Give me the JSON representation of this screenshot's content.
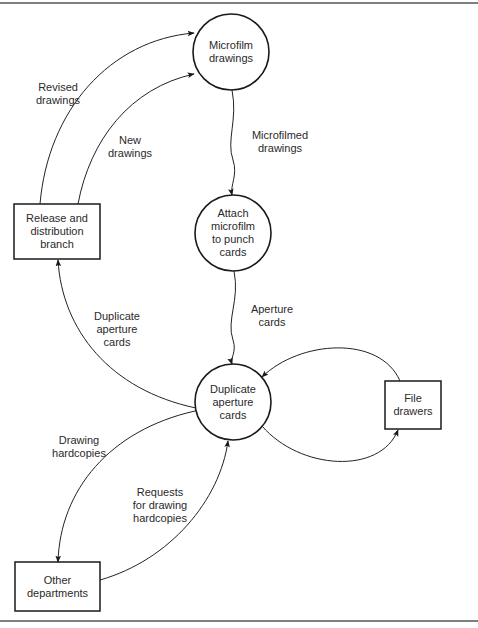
{
  "diagram": {
    "type": "data-flow-diagram",
    "nodes": {
      "microfilm": {
        "shape": "circle",
        "lines": [
          "Microfilm",
          "drawings"
        ]
      },
      "attach": {
        "shape": "circle",
        "lines": [
          "Attach",
          "microfilm",
          "to punch",
          "cards"
        ]
      },
      "duplicate": {
        "shape": "circle",
        "lines": [
          "Duplicate",
          "aperture",
          "cards"
        ]
      },
      "release": {
        "shape": "box",
        "lines": [
          "Release and",
          "distribution",
          "branch"
        ]
      },
      "file_drawers": {
        "shape": "box",
        "lines": [
          "File",
          "drawers"
        ]
      },
      "other_departments": {
        "shape": "box",
        "lines": [
          "Other",
          "departments"
        ]
      }
    },
    "flows": {
      "revised_drawings": {
        "from": "Release and distribution branch",
        "to": "Microfilm drawings",
        "lines": [
          "Revised",
          "drawings"
        ]
      },
      "new_drawings": {
        "from": "Release and distribution branch",
        "to": "Microfilm drawings",
        "lines": [
          "New",
          "drawings"
        ]
      },
      "microfilmed_drawings": {
        "from": "Microfilm drawings",
        "to": "Attach microfilm to punch cards",
        "lines": [
          "Microfilmed",
          "drawings"
        ]
      },
      "aperture_cards": {
        "from": "Attach microfilm to punch cards",
        "to": "Duplicate aperture cards",
        "lines": [
          "Aperture",
          "cards"
        ]
      },
      "duplicate_aperture_cards": {
        "from": "Duplicate aperture cards",
        "to": "Release and distribution branch",
        "lines": [
          "Duplicate",
          "aperture",
          "cards"
        ]
      },
      "drawing_hardcopies": {
        "from": "Duplicate aperture cards",
        "to": "Other departments",
        "lines": [
          "Drawing",
          "hardcopies"
        ]
      },
      "requests_for_drawing_hardcopies": {
        "from": "Other departments",
        "to": "Duplicate aperture cards",
        "lines": [
          "Requests",
          "for drawing",
          "hardcopies"
        ]
      },
      "to_file_drawers": {
        "from": "Duplicate aperture cards",
        "to": "File drawers",
        "lines": []
      },
      "from_file_drawers": {
        "from": "File drawers",
        "to": "Duplicate aperture cards",
        "lines": []
      }
    }
  }
}
